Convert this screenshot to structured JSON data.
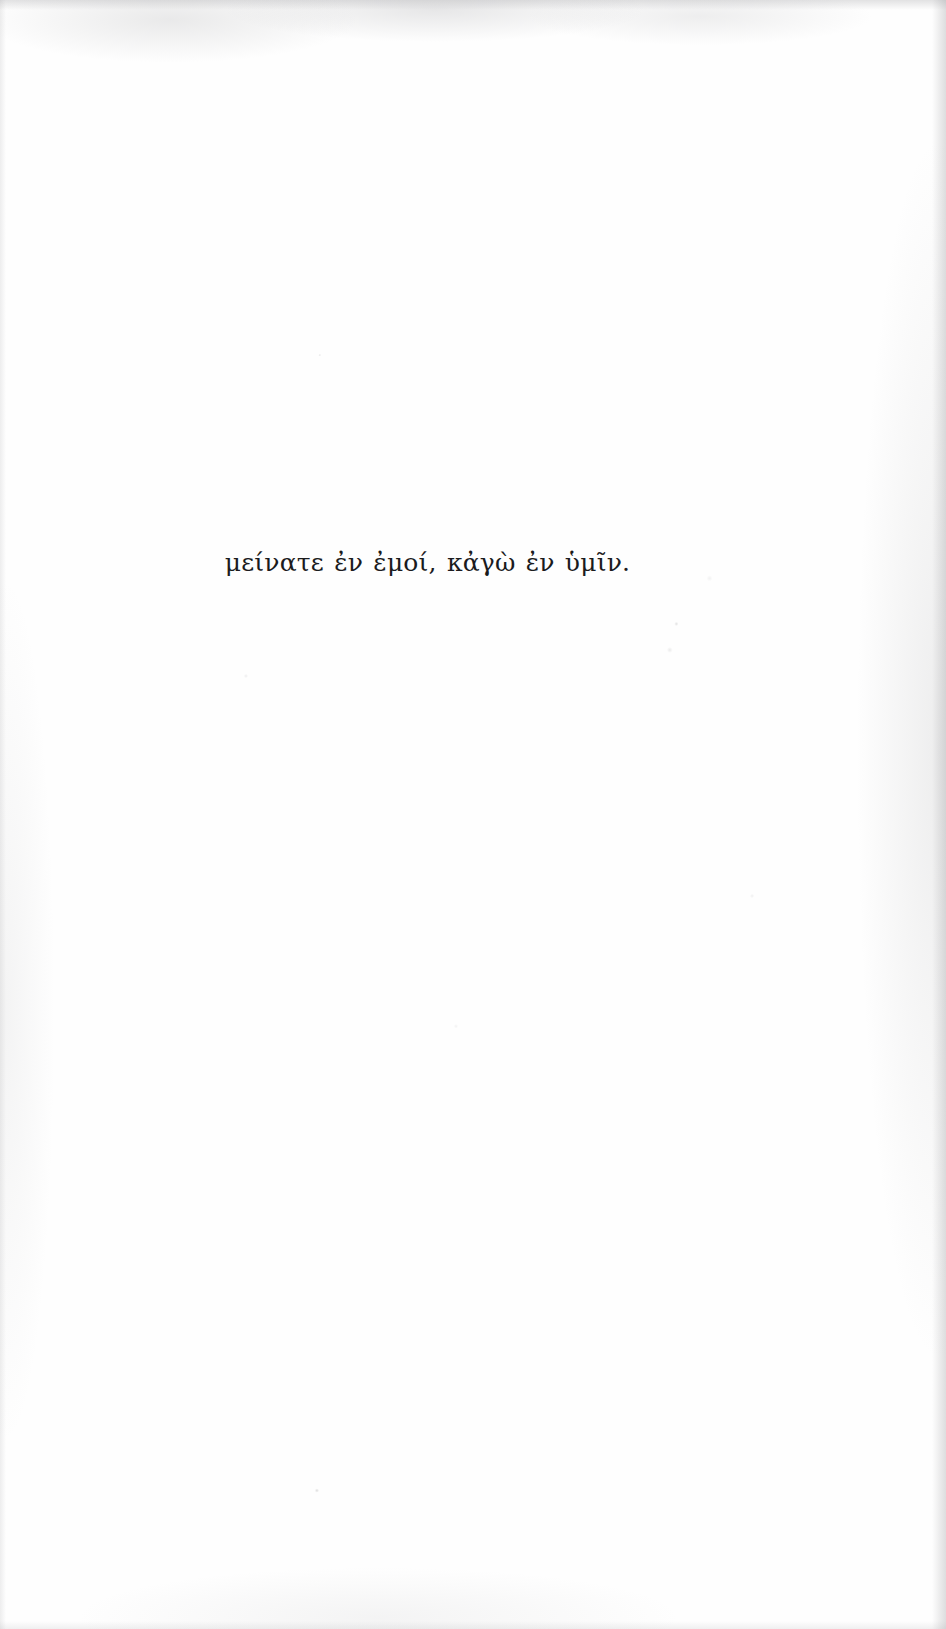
{
  "page": {
    "kind": "scanned-book-page",
    "width": 946,
    "height": 1629,
    "background_color": "#fefefe",
    "ink_color": "#1b1b1d"
  },
  "epigraph": {
    "text": "μείνατε ἐν ἐμοί, κἀγὼ ἐν ὑμῖν.",
    "language": "Greek (polytonic)",
    "alignment": "center"
  }
}
